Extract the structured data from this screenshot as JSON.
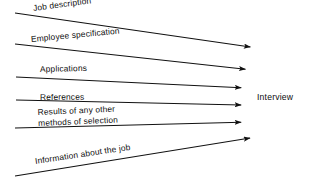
{
  "diagram": {
    "type": "converging-arrow-flow",
    "title": "",
    "background_color": "#ffffff",
    "stroke_color": "#111111",
    "text_color": "#0d0d0d",
    "target": {
      "label": "Interview",
      "x": 257,
      "y": 92
    },
    "inputs": [
      {
        "id": "job-description",
        "label": "Job description",
        "label_x": 33,
        "label_y": 3,
        "label_rotation": -7.5,
        "line": {
          "x1": 15,
          "y1": 13,
          "x2": 257,
          "y2": 48
        }
      },
      {
        "id": "employee-specification",
        "label": "Employee specification",
        "label_x": 31,
        "label_y": 34,
        "label_rotation": -5.5,
        "line": {
          "x1": 15,
          "y1": 44,
          "x2": 252,
          "y2": 70
        }
      },
      {
        "id": "applications",
        "label": "Applications",
        "label_x": 40,
        "label_y": 64,
        "label_rotation": -1.5,
        "line": {
          "x1": 16,
          "y1": 77,
          "x2": 248,
          "y2": 88
        }
      },
      {
        "id": "references",
        "label": "References",
        "label_x": 40,
        "label_y": 92,
        "label_rotation": -0.5,
        "line": {
          "x1": 16,
          "y1": 100,
          "x2": 248,
          "y2": 105
        }
      },
      {
        "id": "results-other-methods",
        "label": "Results of any other methods of selection",
        "label_line_1": "Results of any other",
        "label_line_2": "methods of selection",
        "label_x": 38,
        "label_y": 107,
        "label_rotation": -2.5,
        "line": {
          "x1": 15,
          "y1": 128,
          "x2": 248,
          "y2": 122
        }
      },
      {
        "id": "information-about-job",
        "label": "Information about the job",
        "label_x": 35,
        "label_y": 156,
        "label_rotation": -8.5,
        "line": {
          "x1": 15,
          "y1": 176,
          "x2": 257,
          "y2": 137
        }
      }
    ]
  }
}
